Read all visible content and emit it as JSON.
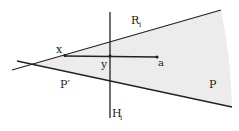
{
  "diagram": {
    "labels": {
      "R": "R",
      "R_sub": "i",
      "H": "H",
      "H_sub": "i",
      "x": "x",
      "y": "y",
      "a": "a",
      "P": "P",
      "P_prime": "P′"
    },
    "colors": {
      "stroke": "#222222",
      "region_fill": "#ececec"
    },
    "points": {
      "apex": [
        32,
        64
      ],
      "x": [
        65,
        54
      ],
      "y": [
        110,
        56
      ],
      "a": [
        157,
        57
      ]
    }
  }
}
